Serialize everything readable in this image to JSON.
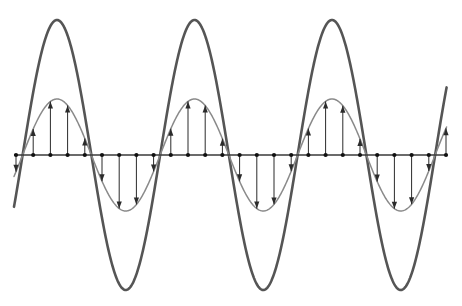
{
  "canvas": {
    "width": 462,
    "height": 306,
    "background": "#ffffff"
  },
  "colors": {
    "outer_wave": "#555555",
    "inner_wave": "#8a8a8a",
    "axis": "#3a3a3a",
    "dot": "#111111",
    "arrow": "#2b2b2b"
  },
  "chart_data": {
    "type": "line",
    "title": "",
    "subtitle": "",
    "xlabel": "",
    "ylabel": "",
    "grid": false,
    "legend": "none",
    "axis_line": {
      "y_pixel": 155,
      "x_start_pixel": 14,
      "x_end_pixel": 447,
      "x_start": 0,
      "x_end": 3.15
    },
    "xlim": [
      0,
      3.15
    ],
    "ylim": [
      -1,
      1
    ],
    "x_unit": "cycles",
    "period_pixels": 137.5,
    "cycles_shown": 3,
    "series": [
      {
        "name": "outer-wave",
        "role": "large-amplitude-sine",
        "color": "#555555",
        "amplitude": 1.0,
        "amplitude_pixels": 135,
        "line_width": 2.6,
        "peak_y_pixel": 20,
        "trough_y_pixel": 290,
        "peaks_x_pixels": [
          57,
          194,
          332
        ],
        "troughs_x_pixels": [
          126,
          263,
          401
        ]
      },
      {
        "name": "inner-wave",
        "role": "small-amplitude-sine",
        "color": "#8a8a8a",
        "amplitude": 0.41,
        "amplitude_pixels": 56,
        "line_width": 1.5,
        "peak_y_pixel": 99,
        "trough_y_pixel": 211,
        "peaks_x_pixels": [
          57,
          194,
          332
        ],
        "troughs_x_pixels": [
          126,
          263,
          401
        ]
      }
    ],
    "sample_points": {
      "description": "Equally spaced markers on the axis; each carries a vector arrow whose tip lies on the inner wave.",
      "count": 26,
      "spacing_pixels": 17.2,
      "first_x_pixel": 16,
      "marker": "dot",
      "marker_radius": 2.1
    },
    "arrows": {
      "description": "Vertical vectors drawn from each axis sample point to the small-amplitude sine curve; upward in positive half-cycles, downward in negative half-cycles.",
      "head_length": 7,
      "head_half_width": 2.6,
      "stroke_width": 1.0,
      "direction_positive": "up",
      "direction_negative": "down"
    }
  },
  "figure": {
    "caption": "",
    "alt": "Two superimposed sine waves of different amplitudes sharing a horizontal axis, with vertical arrows at evenly spaced points showing the displacement of the smaller wave."
  }
}
